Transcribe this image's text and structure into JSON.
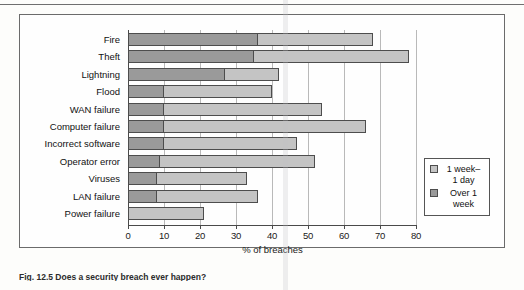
{
  "figure": {
    "caption": "Fig. 12.5   Does a security breach ever happen?"
  },
  "legend": {
    "items": [
      {
        "label": "1 week–\n1 day",
        "color": "#c4c4c4",
        "name": "legend-swatch-one-week-one-day"
      },
      {
        "label": "Over 1\nweek",
        "color": "#9a9a9a",
        "name": "legend-swatch-over-one-week"
      }
    ]
  },
  "chart_data": {
    "type": "bar",
    "orientation": "horizontal",
    "stacked": true,
    "title": "",
    "xlabel": "% of breaches",
    "ylabel": "",
    "xlim": [
      0,
      80
    ],
    "xticks": [
      0,
      10,
      20,
      30,
      40,
      50,
      60,
      70,
      80
    ],
    "grid": "vertical",
    "legend_position": "right",
    "categories": [
      "Fire",
      "Theft",
      "Lightning",
      "Flood",
      "WAN failure",
      "Computer failure",
      "Incorrect software",
      "Operator error",
      "Viruses",
      "LAN failure",
      "Power failure"
    ],
    "series": [
      {
        "name": "Over 1 week",
        "color": "#9a9a9a",
        "values": [
          36,
          35,
          27,
          10,
          10,
          10,
          10,
          9,
          8,
          8,
          0
        ]
      },
      {
        "name": "1 week–1 day",
        "color": "#c4c4c4",
        "values": [
          32,
          43,
          15,
          30,
          44,
          56,
          37,
          43,
          25,
          28,
          21
        ]
      }
    ],
    "totals": [
      68,
      78,
      42,
      40,
      54,
      66,
      47,
      52,
      33,
      36,
      21
    ]
  }
}
